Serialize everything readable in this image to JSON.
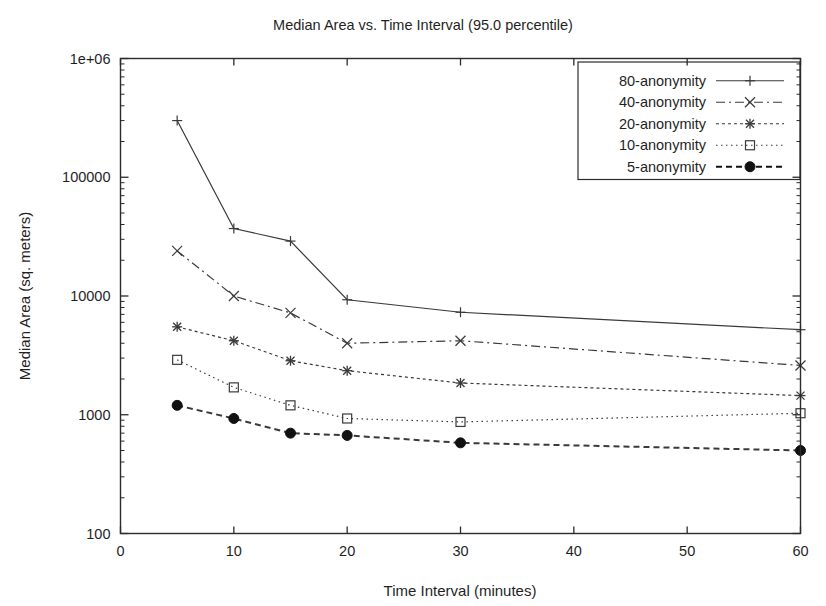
{
  "chart_data": {
    "type": "line",
    "title": "Median Area vs. Time Interval (95.0 percentile)",
    "xlabel": "Time Interval (minutes)",
    "ylabel": "Median Area (sq. meters)",
    "xlim": [
      0,
      60
    ],
    "ylim": [
      100,
      1000000
    ],
    "yscale": "log",
    "xscale": "linear",
    "grid": false,
    "legend_position": "top-right",
    "xticks": [
      "0",
      "10",
      "20",
      "30",
      "40",
      "50",
      "60"
    ],
    "xtick_values": [
      0,
      10,
      20,
      30,
      40,
      50,
      60
    ],
    "yticks": [
      "100",
      "1000",
      "10000",
      "100000",
      "1e+06"
    ],
    "ytick_values": [
      100,
      1000,
      10000,
      100000,
      1000000
    ],
    "x": [
      5,
      10,
      15,
      20,
      30,
      60
    ],
    "series": [
      {
        "name": "80-anonymity",
        "marker": "plus",
        "linestyle": "solid",
        "color": "#3a3a3a",
        "values": [
          300000,
          37000,
          29000,
          9300,
          7300,
          5200
        ]
      },
      {
        "name": "40-anonymity",
        "marker": "cross",
        "linestyle": "dashdot",
        "color": "#3a3a3a",
        "values": [
          24000,
          10000,
          7200,
          4000,
          4200,
          2600
        ]
      },
      {
        "name": "20-anonymity",
        "marker": "star",
        "linestyle": "dashed",
        "color": "#3a3a3a",
        "values": [
          5500,
          4200,
          2850,
          2350,
          1850,
          1450
        ]
      },
      {
        "name": "10-anonymity",
        "marker": "square",
        "linestyle": "dotted",
        "color": "#3a3a3a",
        "values": [
          2900,
          1700,
          1200,
          930,
          870,
          1030
        ]
      },
      {
        "name": "5-anonymity",
        "marker": "filled-circle",
        "linestyle": "dashed-bold",
        "color": "#111111",
        "values": [
          1200,
          930,
          700,
          670,
          580,
          500
        ]
      }
    ]
  }
}
